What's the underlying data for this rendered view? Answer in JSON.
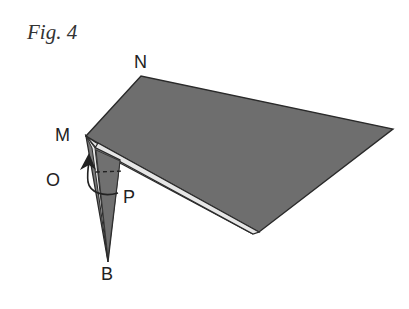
{
  "figure": {
    "title": "Fig. 4",
    "labels": {
      "N": "N",
      "M": "M",
      "O": "O",
      "P": "P",
      "B": "B"
    }
  },
  "colors": {
    "paper_fill": "#6e6e6e",
    "edge": "#2a2a2a",
    "strip": "#e6e6e6",
    "flap_fill": "#7a7a7a",
    "arrow": "#222222"
  }
}
